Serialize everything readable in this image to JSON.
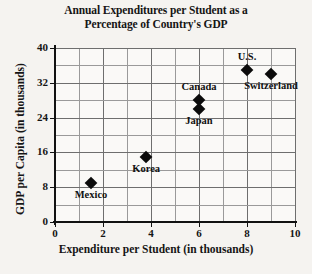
{
  "chart_data": {
    "type": "scatter",
    "title": "Annual Expenditures per Student as a Percentage of Country's GDP",
    "title_lines": [
      "Annual Expenditures per Student as a",
      "Percentage of Country's GDP"
    ],
    "xlabel": "Expenditure per Student (in thousands)",
    "ylabel": "GDP per Capita (in thousands)",
    "xlim": [
      0,
      10
    ],
    "ylim": [
      0,
      40
    ],
    "x_tick_labels": [
      "0",
      "2",
      "4",
      "6",
      "8",
      "10"
    ],
    "x_tick_values": [
      0,
      2,
      4,
      6,
      8,
      10
    ],
    "x_minor_step": 1,
    "y_tick_labels": [
      "0",
      "8",
      "16",
      "24",
      "32",
      "40"
    ],
    "y_tick_values": [
      0,
      8,
      16,
      24,
      32,
      40
    ],
    "y_minor_step": 4,
    "grid": true,
    "legend": "none",
    "marker": "diamond",
    "marker_color": "#0b0b0b",
    "points": [
      {
        "label": "Mexico",
        "x": 1.5,
        "y": 9,
        "label_pos": "below"
      },
      {
        "label": "Korea",
        "x": 3.8,
        "y": 15,
        "label_pos": "below"
      },
      {
        "label": "Japan",
        "x": 6.0,
        "y": 26,
        "label_pos": "below"
      },
      {
        "label": "Canada",
        "x": 6.0,
        "y": 28,
        "label_pos": "above"
      },
      {
        "label": "U.S.",
        "x": 8.0,
        "y": 35,
        "label_pos": "above"
      },
      {
        "label": "Switzerland",
        "x": 9.0,
        "y": 34,
        "label_pos": "below"
      }
    ]
  },
  "colors": {
    "background": "#f5f3f0",
    "plot_background": "#faf9f7",
    "axis": "#111111",
    "gridline_major": "#6e6e6e",
    "gridline_minor": "#9a9a9a",
    "text": "#151515"
  }
}
